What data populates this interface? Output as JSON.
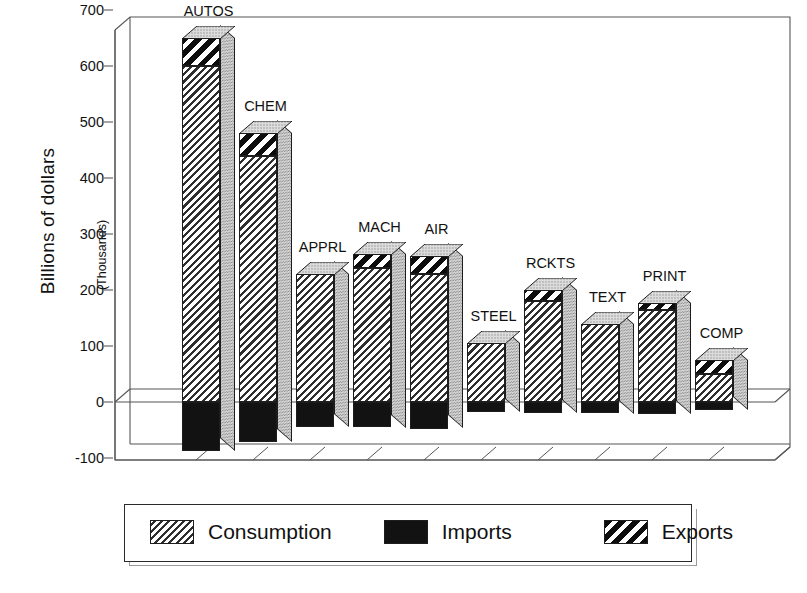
{
  "chart_data": {
    "type": "bar",
    "title": "",
    "subtitle": "",
    "xlabel": "",
    "ylabel": "Billions of dollars",
    "ylabel_sub": "(Thousands)",
    "ylim": [
      -100,
      700
    ],
    "yticks": [
      700,
      600,
      500,
      400,
      300,
      200,
      100,
      0,
      -100
    ],
    "ytick_labels": [
      "700",
      "600",
      "500",
      "400",
      "300",
      "200",
      "100",
      "0",
      "-100"
    ],
    "grid": false,
    "legend_position": "bottom",
    "style": "3d-grayscale",
    "categories": [
      "AUTOS",
      "CHEM",
      "APPRL",
      "MACH",
      "AIR",
      "STEEL",
      "RCKTS",
      "TEXT",
      "PRINT",
      "COMP"
    ],
    "series": [
      {
        "name": "Consumption",
        "pattern": "diagonal-hatch",
        "values": [
          600,
          440,
          228,
          240,
          228,
          105,
          180,
          140,
          165,
          50
        ]
      },
      {
        "name": "Exports",
        "pattern": "bold-diagonal-stripe",
        "values": [
          50,
          40,
          0,
          25,
          32,
          0,
          20,
          0,
          12,
          25
        ]
      },
      {
        "name": "Imports",
        "pattern": "solid-black",
        "values": [
          -88,
          -72,
          -45,
          -45,
          -48,
          -18,
          -20,
          -20,
          -22,
          -14
        ]
      }
    ],
    "bar_tops": [
      650,
      480,
      228,
      265,
      260,
      105,
      200,
      140,
      177,
      75
    ],
    "legend": [
      {
        "label": "Consumption",
        "swatch": "diagonal-hatch"
      },
      {
        "label": "Imports",
        "swatch": "solid-black"
      },
      {
        "label": "Exports",
        "swatch": "bold-diagonal-stripe"
      }
    ]
  },
  "colors": {
    "ink": "#1a1a1a",
    "bar_outline": "#1d1d1d",
    "side_face": "#d6d6d6",
    "imports_fill": "#121212",
    "background": "#ffffff"
  }
}
